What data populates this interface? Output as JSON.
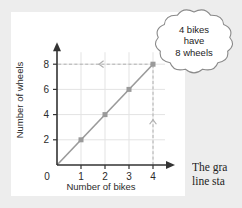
{
  "page": {
    "background_color": "#ededed",
    "panel_color": "#ffffff"
  },
  "body_text": {
    "line1": "The gra",
    "line2": "line sta"
  },
  "callout": {
    "name": "cloud-callout",
    "line1": "4 bikes",
    "line2": "have",
    "line3": "8 wheels",
    "border_color": "#8a8a8a",
    "fill_color": "#ffffff"
  },
  "chart_data": {
    "type": "line",
    "title": "",
    "xlabel": "Number of bikes",
    "ylabel": "Number of wheels",
    "x": [
      0,
      1,
      2,
      3,
      4
    ],
    "values": [
      0,
      2,
      4,
      6,
      8
    ],
    "series": [
      {
        "name": "wheels",
        "values": [
          0,
          2,
          4,
          6,
          8
        ]
      }
    ],
    "markers": [
      {
        "x": 1,
        "y": 2
      },
      {
        "x": 2,
        "y": 4
      },
      {
        "x": 3,
        "y": 6
      },
      {
        "x": 4,
        "y": 8
      }
    ],
    "xlim": [
      0,
      4
    ],
    "ylim": [
      0,
      8
    ],
    "xticks": [
      "0",
      "1",
      "2",
      "3",
      "4"
    ],
    "yticks": [
      "0",
      "2",
      "4",
      "6",
      "8"
    ],
    "xtick_values": [
      0,
      1,
      2,
      3,
      4
    ],
    "ytick_values": [
      0,
      2,
      4,
      6,
      8
    ],
    "grid": true,
    "legend": false,
    "line_color": "#9a9a9a",
    "marker_color": "#9a9a9a",
    "grid_color": "#e3e3e3",
    "axis_color": "#333333",
    "annotations": [
      {
        "type": "guide-line",
        "orientation": "vertical",
        "at_x": 4,
        "from_y": 0,
        "to_y": 8,
        "arrow": "up",
        "style": "dashed"
      },
      {
        "type": "guide-line",
        "orientation": "horizontal",
        "at_y": 8,
        "from_x": 4,
        "to_x": 0,
        "arrow": "left",
        "style": "dashed"
      }
    ],
    "guide_color": "#b0b0b0"
  }
}
